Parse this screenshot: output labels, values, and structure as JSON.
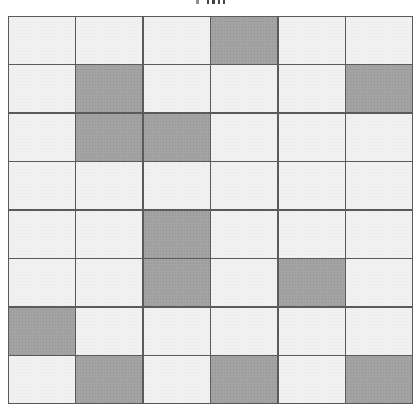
{
  "diagram": {
    "type": "binary-grid",
    "rows": 8,
    "columns": 6,
    "colors": {
      "filled": "#a3a3a3",
      "empty": "#f1f1f1",
      "border": "#5a5a5a"
    },
    "cells": [
      [
        0,
        0,
        0,
        1,
        0,
        0
      ],
      [
        0,
        1,
        0,
        0,
        0,
        1
      ],
      [
        0,
        1,
        1,
        0,
        0,
        0
      ],
      [
        0,
        0,
        0,
        0,
        0,
        0
      ],
      [
        0,
        0,
        1,
        0,
        0,
        0
      ],
      [
        0,
        0,
        1,
        0,
        1,
        0
      ],
      [
        1,
        0,
        0,
        0,
        0,
        0
      ],
      [
        0,
        1,
        0,
        1,
        0,
        1
      ]
    ],
    "filled_count": 12
  }
}
